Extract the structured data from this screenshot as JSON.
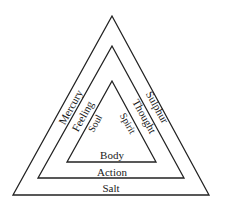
{
  "diagram": {
    "type": "nested-triangles",
    "stroke_color": "#222222",
    "text_color": "#1a1a1a",
    "background": "#ffffff",
    "outer": {
      "points": [
        [
          112,
          16
        ],
        [
          13,
          195
        ],
        [
          209,
          195
        ]
      ],
      "left_label": "Mercury",
      "right_label": "Sulphur",
      "bottom_label": "Salt"
    },
    "middle": {
      "points": [
        [
          112,
          46
        ],
        [
          38,
          178
        ],
        [
          184,
          178
        ]
      ],
      "left_label": "Feeling",
      "right_label": "Thought",
      "bottom_label": "Action"
    },
    "inner": {
      "points": [
        [
          112,
          81
        ],
        [
          67,
          162
        ],
        [
          156,
          162
        ]
      ],
      "left_label": "Soul",
      "right_label": "Spirit",
      "bottom_label": "Body"
    }
  }
}
